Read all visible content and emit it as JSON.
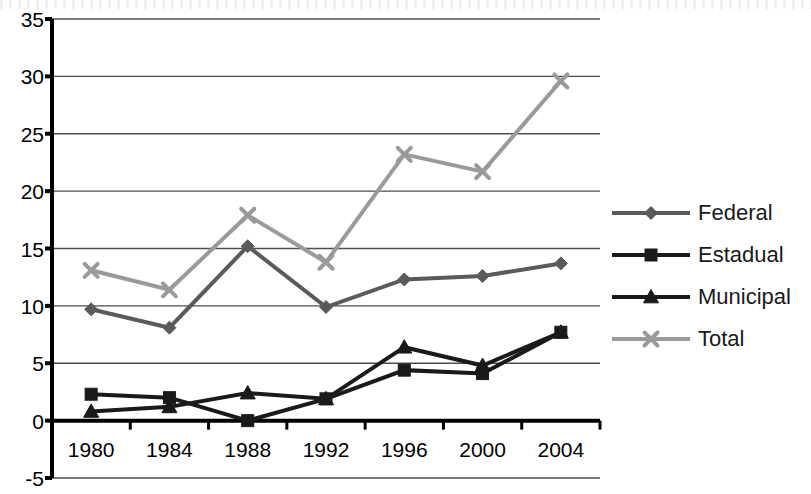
{
  "chart_data": {
    "type": "line",
    "title": "",
    "xlabel": "",
    "ylabel": "",
    "categories": [
      "1980",
      "1984",
      "1988",
      "1992",
      "1996",
      "2000",
      "2004"
    ],
    "x": [
      1980,
      1984,
      1988,
      1992,
      1996,
      2000,
      2004
    ],
    "ylim": [
      -5,
      35
    ],
    "yticks": [
      -5,
      0,
      5,
      10,
      15,
      20,
      25,
      30,
      35
    ],
    "grid": true,
    "legend_position": "right",
    "series": [
      {
        "name": "Federal",
        "color": "#5a5a5a",
        "marker": "diamond",
        "values": [
          9.7,
          8.1,
          15.2,
          9.9,
          12.3,
          12.6,
          13.7
        ]
      },
      {
        "name": "Estadual",
        "color": "#1a1a1a",
        "marker": "square",
        "values": [
          2.3,
          2.0,
          0.0,
          1.9,
          4.4,
          4.1,
          7.7
        ]
      },
      {
        "name": "Municipal",
        "color": "#1a1a1a",
        "marker": "triangle",
        "values": [
          0.8,
          1.2,
          2.4,
          1.9,
          6.4,
          4.8,
          7.7
        ]
      },
      {
        "name": "Total",
        "color": "#9a9a9a",
        "marker": "x",
        "values": [
          13.1,
          11.4,
          17.9,
          13.8,
          23.2,
          21.7,
          29.6
        ]
      }
    ]
  },
  "axes": {
    "y_tick_labels": [
      "35",
      "30",
      "25",
      "20",
      "15",
      "10",
      "5",
      "0",
      "-5"
    ],
    "x_tick_labels": [
      "1980",
      "1984",
      "1988",
      "1992",
      "1996",
      "2000",
      "2004"
    ]
  },
  "legend": {
    "items": [
      {
        "label": "Federal",
        "color": "#5a5a5a",
        "marker": "diamond"
      },
      {
        "label": "Estadual",
        "color": "#1a1a1a",
        "marker": "square"
      },
      {
        "label": "Municipal",
        "color": "#1a1a1a",
        "marker": "triangle"
      },
      {
        "label": "Total",
        "color": "#9a9a9a",
        "marker": "x"
      }
    ]
  },
  "colors": {
    "federal": "#5a5a5a",
    "estadual": "#1a1a1a",
    "municipal": "#1a1a1a",
    "total": "#9a9a9a",
    "axis": "#000000",
    "grid": "#4d4d4d",
    "background": "#ffffff"
  }
}
